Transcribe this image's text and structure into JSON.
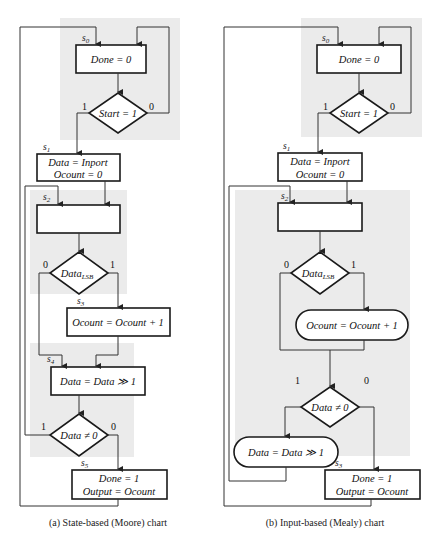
{
  "diagram": {
    "colors": {
      "state_region": "#ebebeb",
      "stroke": "#1a1a1a",
      "background": "#ffffff"
    },
    "moore": {
      "caption": "(a)  State-based (Moore) chart",
      "states": {
        "s0": {
          "name": "s",
          "sub": "0",
          "action": "Done = 0"
        },
        "s1": {
          "name": "s",
          "sub": "1",
          "action_line1": "Data = Inport",
          "action_line2": "Ocount = 0"
        },
        "s2": {
          "name": "s",
          "sub": "2",
          "action": ""
        },
        "s3": {
          "name": "s",
          "sub": "3",
          "action": "Ocount = Ocount + 1"
        },
        "s4": {
          "name": "s",
          "sub": "4",
          "action": "Data = Data ≫ 1"
        },
        "s5": {
          "name": "s",
          "sub": "5",
          "action_line1": "Done = 1",
          "action_line2": "Output = Ocount"
        }
      },
      "decisions": {
        "start": {
          "text": "Start = 1",
          "true_label": "1",
          "false_label": "0"
        },
        "lsb": {
          "text": "Data",
          "sub": "LSB",
          "true_label": "1",
          "false_label": "0"
        },
        "nonzero": {
          "text": "Data ≠ 0",
          "true_label": "1",
          "false_label": "0"
        }
      }
    },
    "mealy": {
      "caption": "(b)  Input-based (Mealy) chart",
      "states": {
        "s0": {
          "name": "s",
          "sub": "0",
          "action": "Done = 0"
        },
        "s1": {
          "name": "s",
          "sub": "1",
          "action_line1": "Data = Inport",
          "action_line2": "Ocount = 0"
        },
        "s2": {
          "name": "s",
          "sub": "2",
          "action": ""
        },
        "s3": {
          "name": "s",
          "sub": "3",
          "action_line1": "Done = 1",
          "action_line2": "Output = Ocount"
        }
      },
      "conditional_outputs": {
        "inc": {
          "text": "Ocount = Ocount + 1"
        },
        "shift": {
          "text": "Data = Data ≫ 1"
        }
      },
      "decisions": {
        "start": {
          "text": "Start = 1",
          "true_label": "1",
          "false_label": "0"
        },
        "lsb": {
          "text": "Data",
          "sub": "LSB",
          "true_label": "1",
          "false_label": "0"
        },
        "nonzero": {
          "text": "Data ≠ 0",
          "true_label": "1",
          "false_label": "0"
        }
      }
    }
  }
}
